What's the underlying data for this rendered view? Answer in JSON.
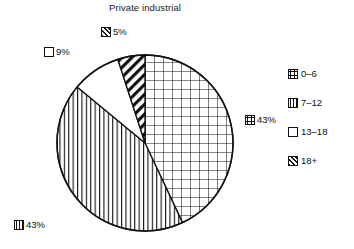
{
  "chart_data": {
    "type": "pie",
    "title": "Private industrial",
    "xlabel": "",
    "ylabel": "",
    "legend_position": "right",
    "grid": false,
    "categories": [
      "0–6",
      "7–12",
      "13–18",
      "18+"
    ],
    "values": [
      43,
      43,
      9,
      5
    ],
    "value_labels": [
      "43%",
      "43%",
      "9%",
      "5%"
    ],
    "units": "percent",
    "start_angle_deg": 0,
    "direction": "clockwise",
    "slices": [
      {
        "label": "0–6",
        "value": 43,
        "value_label": "43%",
        "pattern": "grid",
        "start_deg": 0,
        "end_deg": 154.8
      },
      {
        "label": "7–12",
        "value": 43,
        "value_label": "43%",
        "pattern": "vertical-lines",
        "start_deg": 154.8,
        "end_deg": 309.6
      },
      {
        "label": "13–18",
        "value": 9,
        "value_label": "9%",
        "pattern": "blank",
        "start_deg": 309.6,
        "end_deg": 342.0
      },
      {
        "label": "18+",
        "value": 5,
        "value_label": "5%",
        "pattern": "diagonal-hatch",
        "start_deg": 342.0,
        "end_deg": 360.0
      }
    ]
  },
  "title": {
    "text": "Private industrial"
  },
  "data_labels": [
    {
      "id": "18plus",
      "text": "5%",
      "pattern": "diagonal-hatch"
    },
    {
      "id": "13-18",
      "text": "9%",
      "pattern": "blank"
    },
    {
      "id": "0-6",
      "text": "43%",
      "pattern": "grid"
    },
    {
      "id": "7-12",
      "text": "43%",
      "pattern": "vertical-lines"
    }
  ],
  "legend": {
    "items": [
      {
        "label": "0–6",
        "pattern": "grid"
      },
      {
        "label": "7–12",
        "pattern": "vertical-lines"
      },
      {
        "label": "13–18",
        "pattern": "blank"
      },
      {
        "label": "18+",
        "pattern": "diagonal-hatch"
      }
    ]
  },
  "colors": {
    "ink": "#111111",
    "background": "#ffffff"
  }
}
